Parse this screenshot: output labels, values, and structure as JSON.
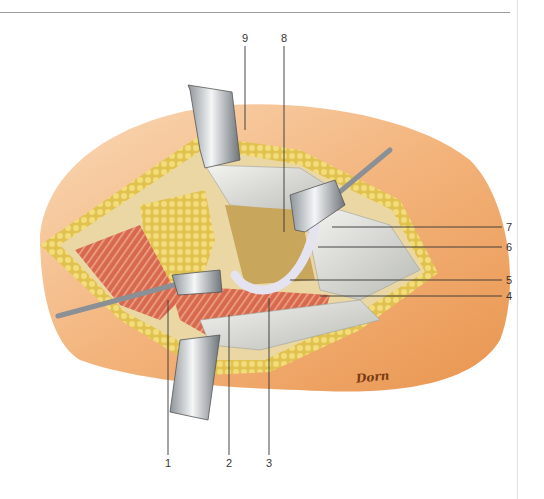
{
  "figure": {
    "type": "anatomical surgical illustration",
    "artist_signature": "Dorn",
    "labels": [
      {
        "id": "1",
        "text": "1",
        "x": 167,
        "y": 461,
        "leader": {
          "x1": 168,
          "y1": 300,
          "x2": 168,
          "y2": 455
        }
      },
      {
        "id": "2",
        "text": "2",
        "x": 228,
        "y": 461,
        "leader": {
          "x1": 229,
          "y1": 315,
          "x2": 229,
          "y2": 455
        }
      },
      {
        "id": "3",
        "text": "3",
        "x": 268,
        "y": 461,
        "leader": {
          "x1": 269,
          "y1": 298,
          "x2": 269,
          "y2": 455
        }
      },
      {
        "id": "4",
        "text": "4",
        "x": 508,
        "y": 292,
        "leader": {
          "x1": 320,
          "y1": 296,
          "x2": 502,
          "y2": 296
        }
      },
      {
        "id": "5",
        "text": "5",
        "x": 508,
        "y": 276,
        "leader": {
          "x1": 290,
          "y1": 280,
          "x2": 502,
          "y2": 280
        }
      },
      {
        "id": "6",
        "text": "6",
        "x": 508,
        "y": 243,
        "leader": {
          "x1": 318,
          "y1": 247,
          "x2": 502,
          "y2": 247
        }
      },
      {
        "id": "7",
        "text": "7",
        "x": 508,
        "y": 223,
        "leader": {
          "x1": 332,
          "y1": 227,
          "x2": 502,
          "y2": 227
        }
      },
      {
        "id": "8",
        "text": "8",
        "x": 281,
        "y": 34,
        "leader": {
          "x1": 284,
          "y1": 46,
          "x2": 284,
          "y2": 232
        }
      },
      {
        "id": "9",
        "text": "9",
        "x": 242,
        "y": 34,
        "leader": {
          "x1": 245,
          "y1": 46,
          "x2": 245,
          "y2": 130
        }
      }
    ],
    "colors": {
      "skin": "#f2b27a",
      "skin_light": "#f8d3ad",
      "fat": "#e8c95a",
      "muscle": "#d9694f",
      "fascia": "#dcdcd6",
      "bone": "#c9a860",
      "retractor": "#b8bcc0",
      "leader_line": "#333333"
    }
  }
}
